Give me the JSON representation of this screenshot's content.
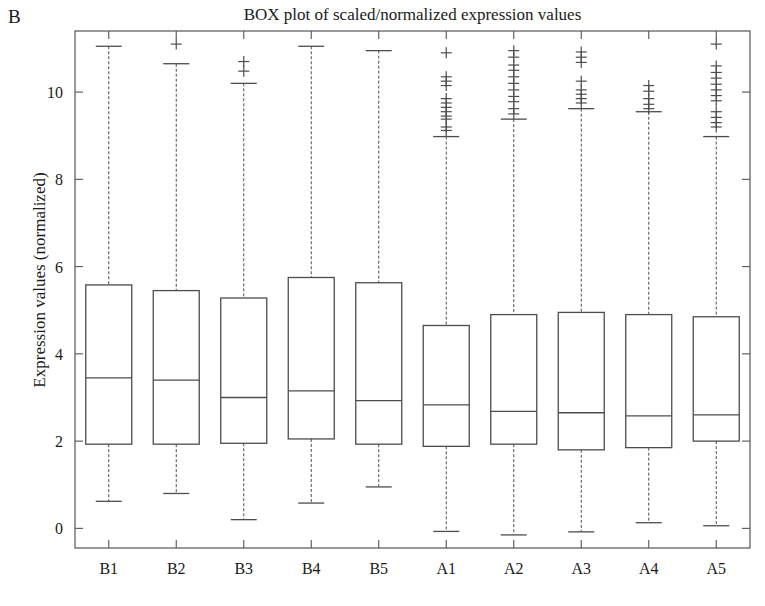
{
  "panel": {
    "label": "B"
  },
  "chart_data": {
    "type": "box",
    "title": "BOX plot of scaled/normalized expression values",
    "xlabel": "",
    "ylabel": "Expression values (normalized)",
    "categories": [
      "B1",
      "B2",
      "B3",
      "B4",
      "B5",
      "A1",
      "A2",
      "A3",
      "A4",
      "A5"
    ],
    "yticks": [
      0,
      2,
      4,
      6,
      8,
      10
    ],
    "ylim": [
      -0.45,
      11.4
    ],
    "grid": false,
    "legend": null,
    "box_color": "#4d4d4d",
    "outlier_marker": "+",
    "boxes": [
      {
        "category": "B1",
        "whisker_low": 0.62,
        "q1": 1.93,
        "median": 3.45,
        "q3": 5.58,
        "whisker_high": 11.05,
        "outliers": []
      },
      {
        "category": "B2",
        "whisker_low": 0.8,
        "q1": 1.93,
        "median": 3.4,
        "q3": 5.45,
        "whisker_high": 10.65,
        "outliers": [
          11.1
        ]
      },
      {
        "category": "B3",
        "whisker_low": 0.2,
        "q1": 1.95,
        "median": 3.0,
        "q3": 5.28,
        "whisker_high": 10.2,
        "outliers": [
          10.7,
          10.48
        ]
      },
      {
        "category": "B4",
        "whisker_low": 0.58,
        "q1": 2.05,
        "median": 3.15,
        "q3": 5.75,
        "whisker_high": 11.05,
        "outliers": []
      },
      {
        "category": "B5",
        "whisker_low": 0.95,
        "q1": 1.93,
        "median": 2.93,
        "q3": 5.63,
        "whisker_high": 10.95,
        "outliers": []
      },
      {
        "category": "A1",
        "whisker_low": -0.07,
        "q1": 1.88,
        "median": 2.83,
        "q3": 4.65,
        "whisker_high": 8.98,
        "outliers": [
          10.9,
          10.35,
          10.25,
          10.15,
          9.85,
          9.75,
          9.65,
          9.55,
          9.45,
          9.38,
          9.2,
          9.12
        ]
      },
      {
        "category": "A2",
        "whisker_low": -0.15,
        "q1": 1.93,
        "median": 2.68,
        "q3": 4.9,
        "whisker_high": 9.38,
        "outliers": [
          10.95,
          10.8,
          10.62,
          10.5,
          10.35,
          10.2,
          10.05,
          9.9,
          9.78,
          9.62,
          9.5
        ]
      },
      {
        "category": "A3",
        "whisker_low": -0.08,
        "q1": 1.8,
        "median": 2.65,
        "q3": 4.95,
        "whisker_high": 9.62,
        "outliers": [
          10.92,
          10.8,
          10.68,
          10.25,
          10.05,
          9.95,
          9.85,
          9.75
        ]
      },
      {
        "category": "A4",
        "whisker_low": 0.13,
        "q1": 1.85,
        "median": 2.58,
        "q3": 4.9,
        "whisker_high": 9.55,
        "outliers": [
          10.15,
          10.02,
          9.85,
          9.72,
          9.62
        ]
      },
      {
        "category": "A5",
        "whisker_low": 0.06,
        "q1": 2.0,
        "median": 2.6,
        "q3": 4.85,
        "whisker_high": 8.98,
        "outliers": [
          11.1,
          10.6,
          10.45,
          10.32,
          10.18,
          10.05,
          9.92,
          9.8,
          9.55,
          9.42,
          9.3,
          9.2
        ]
      }
    ]
  }
}
